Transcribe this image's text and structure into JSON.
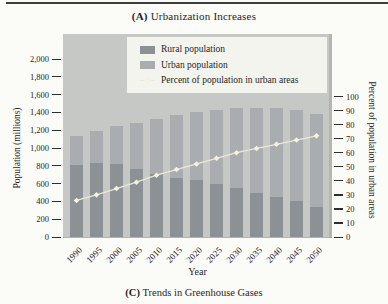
{
  "title": {
    "prefix": "(A)",
    "text": "Urbanization Increases"
  },
  "caption": {
    "prefix": "(C)",
    "text": "Trends in Greenhouse Gases"
  },
  "legend": {
    "rural_label": "Rural population",
    "urban_label": "Urban population",
    "percent_label": "Percent of population in urban areas"
  },
  "colors": {
    "plot_bg": "#c6c8c5",
    "rural": "#8c9195",
    "urban": "#a9adb0",
    "line": "#ebe8d8",
    "marker": "#f5f2e4",
    "legend_bg": "#f4f4ef",
    "tick": "#2e2e2e"
  },
  "chart_data": {
    "type": "bar",
    "subtype": "stacked-bars-with-percent-line",
    "xlabel": "Year",
    "categories": [
      "1990",
      "1995",
      "2000",
      "2005",
      "2010",
      "2015",
      "2020",
      "2025",
      "2030",
      "2035",
      "2040",
      "2045",
      "2050"
    ],
    "series": [
      {
        "name": "Rural population",
        "values": [
          805,
          830,
          820,
          760,
          710,
          660,
          635,
          590,
          545,
          490,
          450,
          400,
          340
        ]
      },
      {
        "name": "Urban population",
        "values": [
          330,
          365,
          430,
          525,
          620,
          710,
          775,
          835,
          900,
          960,
          995,
          1025,
          1040
        ]
      }
    ],
    "line_series": {
      "name": "Percent of population in urban areas",
      "axis": "right",
      "values": [
        26,
        30,
        34.5,
        39,
        44,
        48,
        52,
        56,
        60,
        63,
        66,
        69,
        72
      ]
    },
    "y_left": {
      "label": "Population (millions)",
      "min": 0,
      "max": 2000,
      "tick_step": 200,
      "tick_labels": [
        "0",
        "200",
        "400",
        "600",
        "800",
        "1,000",
        "1,200",
        "1,400",
        "1,600",
        "1,800",
        "2,000"
      ]
    },
    "y_right": {
      "label": "Percent of population in urban areas",
      "min": 0,
      "max": 100,
      "tick_step": 10,
      "tick_labels": [
        "0",
        "10",
        "20",
        "30",
        "40",
        "50",
        "60",
        "70",
        "80",
        "90",
        "100"
      ]
    },
    "legend_position": "top-inside",
    "grid": false
  }
}
